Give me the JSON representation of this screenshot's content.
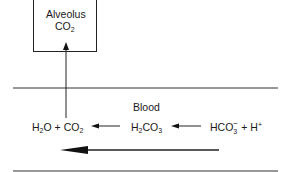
{
  "diagram": {
    "alveolus": {
      "label": "Alveolus",
      "gas": {
        "base": "CO",
        "sub": "2"
      }
    },
    "blood": {
      "label": "Blood"
    },
    "reaction": {
      "products": {
        "water": {
          "base1": "H",
          "sub": "2",
          "base2": "O"
        },
        "plus": "+",
        "co2": {
          "base": "CO",
          "sub": "2"
        }
      },
      "intermediate": {
        "base1": "H",
        "sub": "2",
        "base2": "CO",
        "sub2": "3"
      },
      "reactants": {
        "bicarbonate": {
          "base": "HCO",
          "sub": "3",
          "sup": "−"
        },
        "plus": "+",
        "proton": {
          "base": "H",
          "sup": "+"
        }
      }
    },
    "arrows": {
      "co2_to_alveolus": "up",
      "h2co3_to_products": "left",
      "bicarbonate_to_h2co3": "left",
      "overall_direction": "left"
    },
    "colors": {
      "line": "#222222",
      "text": "#1a1a1a",
      "background": "#ffffff"
    }
  }
}
